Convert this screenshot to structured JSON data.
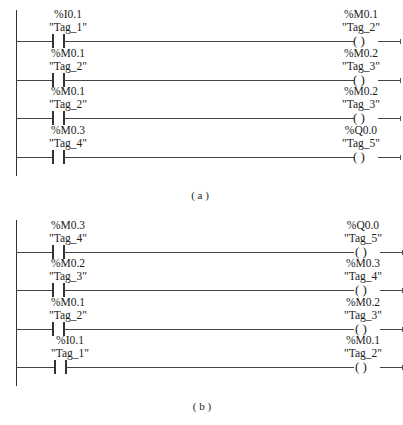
{
  "diagrams": [
    {
      "id": "a",
      "caption": "( a )",
      "rungs": [
        {
          "contact": {
            "address": "%I0.1",
            "tag": "\"Tag_1\""
          },
          "coil": {
            "address": "%M0.1",
            "tag": "\"Tag_2\"",
            "symbol": "(   )"
          }
        },
        {
          "contact": {
            "address": "%M0.1",
            "tag": "\"Tag_2\""
          },
          "coil": {
            "address": "%M0.2",
            "tag": "\"Tag_3\"",
            "symbol": "(   )"
          }
        },
        {
          "contact": {
            "address": "%M0.1",
            "tag": "\"Tag_2\""
          },
          "coil": {
            "address": "%M0.2",
            "tag": "\"Tag_3\"",
            "symbol": "(   )"
          }
        },
        {
          "contact": {
            "address": "%M0.3",
            "tag": "\"Tag_4\""
          },
          "coil": {
            "address": "%Q0.0",
            "tag": "\"Tag_5\"",
            "symbol": "(   )"
          }
        }
      ]
    },
    {
      "id": "b",
      "caption": "( b )",
      "rungs": [
        {
          "contact": {
            "address": "%M0.3",
            "tag": "\"Tag_4\""
          },
          "coil": {
            "address": "%Q0.0",
            "tag": "\"Tag_5\"",
            "symbol": "(   )"
          }
        },
        {
          "contact": {
            "address": "%M0.2",
            "tag": "\"Tag_3\""
          },
          "coil": {
            "address": "%M0.3",
            "tag": "\"Tag_4\"",
            "symbol": "(   )"
          }
        },
        {
          "contact": {
            "address": "%M0.1",
            "tag": "\"Tag_2\""
          },
          "coil": {
            "address": "%M0.2",
            "tag": "\"Tag_3\"",
            "symbol": "(   )"
          }
        },
        {
          "contact": {
            "address": "%I0.1",
            "tag": "\"Tag_1\""
          },
          "coil": {
            "address": "%M0.1",
            "tag": "\"Tag_2\"",
            "symbol": "(   )"
          }
        }
      ]
    }
  ]
}
